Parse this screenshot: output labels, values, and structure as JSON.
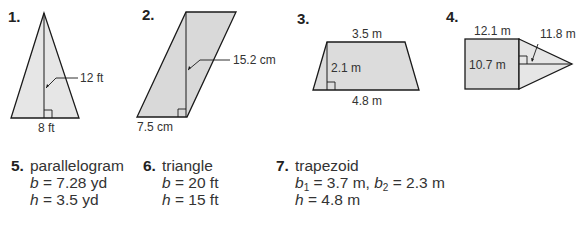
{
  "colors": {
    "fill": "#d9d9d9",
    "stroke": "#1a1a1a",
    "text": "#333333"
  },
  "figures": [
    {
      "number": "1.",
      "shape": "triangle",
      "height_label": "12 ft",
      "base_label": "8 ft"
    },
    {
      "number": "2.",
      "shape": "parallelogram",
      "height_label": "15.2 cm",
      "base_label": "7.5 cm"
    },
    {
      "number": "3.",
      "shape": "trapezoid",
      "top_label": "3.5 m",
      "height_label": "2.1 m",
      "base_label": "4.8 m"
    },
    {
      "number": "4.",
      "shape": "composite-square-triangle",
      "width_label": "12.1 m",
      "side_label": "10.7 m",
      "triangle_height_label": "11.8 m"
    }
  ],
  "problems": [
    {
      "number": "5.",
      "shape": "parallelogram",
      "lines": [
        {
          "var": "b",
          "eq": " = 7.28 yd"
        },
        {
          "var": "h",
          "eq": " = 3.5 yd"
        }
      ]
    },
    {
      "number": "6.",
      "shape": "triangle",
      "lines": [
        {
          "var": "b",
          "eq": " = 20 ft"
        },
        {
          "var": "h",
          "eq": " = 15 ft"
        }
      ]
    },
    {
      "number": "7.",
      "shape": "trapezoid",
      "b1_var": "b",
      "b1_sub": "1",
      "b1_eq": " = 3.7 m, ",
      "b2_var": "b",
      "b2_sub": "2",
      "b2_eq": " = 2.3 m",
      "h_var": "h",
      "h_eq": " = 4.8 m"
    }
  ]
}
